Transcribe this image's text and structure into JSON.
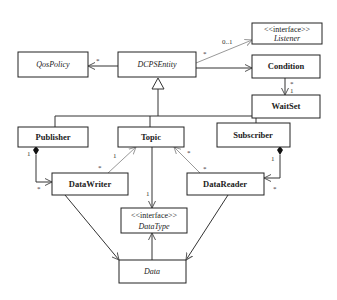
{
  "diagram": {
    "type": "UML class diagram",
    "classes": {
      "listener": {
        "stereotype": "<<interface>>",
        "name": "Listener",
        "italic": true
      },
      "qos_policy": {
        "name": "QosPolicy",
        "italic": true
      },
      "dcps_entity": {
        "name": "DCPSEntity",
        "italic": true
      },
      "condition": {
        "name": "Condition",
        "bold": true
      },
      "waitset": {
        "name": "WaitSet",
        "bold": true
      },
      "publisher": {
        "name": "Publisher",
        "bold": true
      },
      "topic": {
        "name": "Topic",
        "bold": true
      },
      "subscriber": {
        "name": "Subscriber",
        "bold": true
      },
      "datawriter": {
        "name": "DataWriter",
        "bold": true
      },
      "datareader": {
        "name": "DataReader",
        "bold": true
      },
      "datatype": {
        "stereotype": "<<interface>>",
        "name": "DataType",
        "italic": true
      },
      "data": {
        "name": "Data",
        "italic": true
      }
    },
    "multiplicities": {
      "dcps_to_listener_src": "*",
      "dcps_to_listener_dst": "0..1",
      "dcps_to_qos": "*",
      "condition_waitset_top": "*",
      "condition_waitset_bottom": "1",
      "publisher_writer_pub": "1",
      "publisher_writer_writer": "*",
      "topic_writer_topic": "1",
      "topic_writer_writer": "*",
      "topic_datatype": "1",
      "topic_reader_topic": "*",
      "topic_reader_reader": "*",
      "subscriber_reader_sub": "1",
      "subscriber_reader_reader": "*"
    },
    "relationships": [
      {
        "from": "DCPSEntity",
        "to": "Listener",
        "kind": "association"
      },
      {
        "from": "DCPSEntity",
        "to": "QosPolicy",
        "kind": "association"
      },
      {
        "from": "DCPSEntity",
        "to": "Condition",
        "kind": "association"
      },
      {
        "from": "Condition",
        "to": "WaitSet",
        "kind": "association"
      },
      {
        "from": "Publisher",
        "to": "DCPSEntity",
        "kind": "generalization"
      },
      {
        "from": "Topic",
        "to": "DCPSEntity",
        "kind": "generalization"
      },
      {
        "from": "Subscriber",
        "to": "DCPSEntity",
        "kind": "generalization"
      },
      {
        "from": "Publisher",
        "to": "DataWriter",
        "kind": "composition"
      },
      {
        "from": "Subscriber",
        "to": "DataReader",
        "kind": "composition"
      },
      {
        "from": "DataWriter",
        "to": "Topic",
        "kind": "association"
      },
      {
        "from": "DataReader",
        "to": "Topic",
        "kind": "association"
      },
      {
        "from": "Topic",
        "to": "DataType",
        "kind": "association"
      },
      {
        "from": "Data",
        "to": "DataType",
        "kind": "realization"
      },
      {
        "from": "DataWriter",
        "to": "Data",
        "kind": "dependency"
      },
      {
        "from": "DataReader",
        "to": "Data",
        "kind": "dependency"
      }
    ]
  }
}
